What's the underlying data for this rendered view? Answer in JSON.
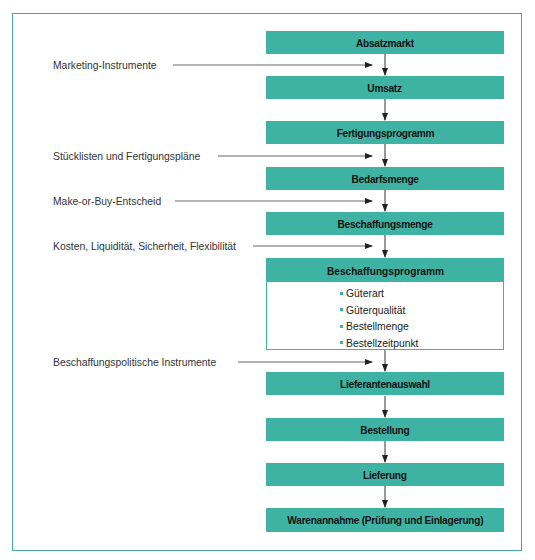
{
  "diagram": {
    "accent_color": "#3fb3a3",
    "frame_color": "#4aa79a",
    "flow_steps": [
      {
        "label": "Absatzmarkt"
      },
      {
        "label": "Umsatz"
      },
      {
        "label": "Fertigungsprogramm"
      },
      {
        "label": "Bedarfsmenge"
      },
      {
        "label": "Beschaffungsmenge"
      },
      {
        "label": "Beschaffungsprogramm",
        "items": [
          "Güterart",
          "Güterqualität",
          "Bestellmenge",
          "Bestellzeitpunkt"
        ]
      },
      {
        "label": "Lieferantenauswahl"
      },
      {
        "label": "Bestellung"
      },
      {
        "label": "Lieferung"
      },
      {
        "label": "Warenannahme (Prüfung und Einlagerung)"
      }
    ],
    "influences": [
      {
        "label": "Marketing-Instrumente",
        "between": [
          "Absatzmarkt",
          "Umsatz"
        ]
      },
      {
        "label": "Stücklisten und Fertigungspläne",
        "between": [
          "Fertigungsprogramm",
          "Bedarfsmenge"
        ]
      },
      {
        "label": "Make-or-Buy-Entscheid",
        "between": [
          "Bedarfsmenge",
          "Beschaffungsmenge"
        ]
      },
      {
        "label": "Kosten, Liquidität, Sicherheit, Flexibilität",
        "between": [
          "Beschaffungsmenge",
          "Beschaffungsprogramm"
        ]
      },
      {
        "label": "Beschaffungspolitische Instrumente",
        "between": [
          "Beschaffungsprogramm",
          "Lieferantenauswahl"
        ]
      }
    ]
  }
}
